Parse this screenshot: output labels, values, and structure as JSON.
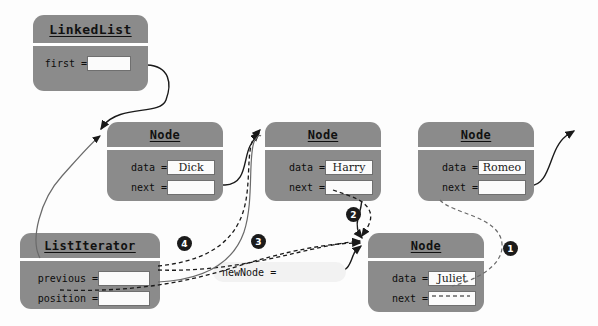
{
  "diagram": {
    "colors": {
      "box_fill": "#8b8b8b",
      "field_fill": "#fbfbfb",
      "badge_fill": "#1b1b1b",
      "badge_text": "#ffffff",
      "wire": "#1a1a1a",
      "background": "#fdfdfd",
      "local_var_fill": "#f2f2f2"
    },
    "linkedlist": {
      "title": "LinkedList",
      "fields": [
        {
          "label": "first =",
          "value": ""
        }
      ]
    },
    "nodes": [
      {
        "id": "dick",
        "title": "Node",
        "fields": [
          {
            "label": "data =",
            "value": "Dick"
          },
          {
            "label": "next =",
            "value": ""
          }
        ]
      },
      {
        "id": "harry",
        "title": "Node",
        "fields": [
          {
            "label": "data =",
            "value": "Harry"
          },
          {
            "label": "next =",
            "value": ""
          }
        ]
      },
      {
        "id": "romeo",
        "title": "Node",
        "fields": [
          {
            "label": "data =",
            "value": "Romeo"
          },
          {
            "label": "next =",
            "value": ""
          }
        ]
      },
      {
        "id": "juliet",
        "title": "Node",
        "fields": [
          {
            "label": "data =",
            "value": "Juliet"
          },
          {
            "label": "next =",
            "value": ""
          }
        ]
      }
    ],
    "listiterator": {
      "title": "ListIterator",
      "fields": [
        {
          "label": "previous =",
          "value": ""
        },
        {
          "label": "position =",
          "value": ""
        }
      ]
    },
    "local_variable": {
      "label": "newNode =",
      "value": ""
    },
    "steps": [
      {
        "number": "1"
      },
      {
        "number": "2"
      },
      {
        "number": "3"
      },
      {
        "number": "4"
      }
    ]
  }
}
